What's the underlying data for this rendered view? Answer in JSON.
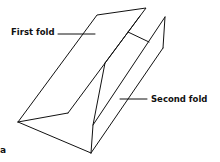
{
  "diagram": {
    "labels": {
      "first_fold": "First fold",
      "second_fold": "Second fold",
      "figure_letter": "a"
    },
    "line_color": "#111111",
    "background": "#ffffff"
  }
}
